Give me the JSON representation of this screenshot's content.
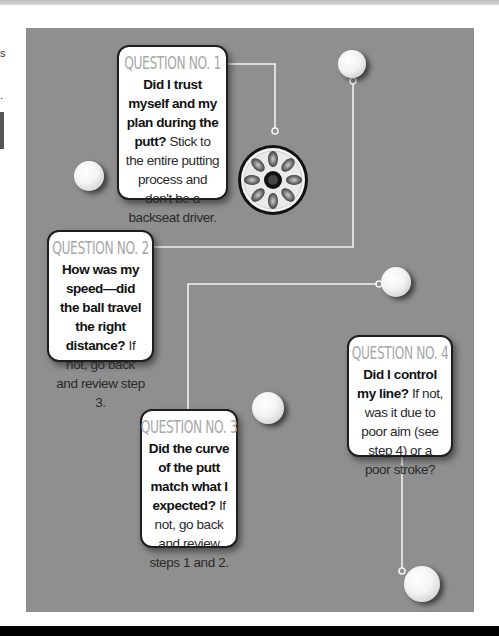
{
  "page": {
    "background_color": "#ffffff",
    "panel_color": "#8f8f8f",
    "connector_color": "#f2f2f2",
    "title_color": "#a7a7a7"
  },
  "questions": [
    {
      "title": "QUESTION NO. 1",
      "bold": "Did I trust myself and my plan during the putt?",
      "text": "Stick to the entire putting process and don't be a backseat driver."
    },
    {
      "title": "QUESTION NO. 2",
      "bold": "How was my speed—did the ball travel the right distance?",
      "text": "If not, go back and review step 3."
    },
    {
      "title": "QUESTION NO. 3",
      "bold": "Did the curve of the putt match what I expected?",
      "text": "If not, go back and review steps 1 and 2."
    },
    {
      "title": "QUESTION NO. 4",
      "bold": "Did I control my line?",
      "text": "If not, was it due to poor aim (see step 4) or a poor stroke?"
    }
  ],
  "images": {
    "golf_balls": [
      "golf-ball-left",
      "golf-ball-top",
      "golf-ball-mid-right",
      "golf-ball-center",
      "golf-ball-bottom"
    ],
    "cup": "hole-cup-drain"
  }
}
